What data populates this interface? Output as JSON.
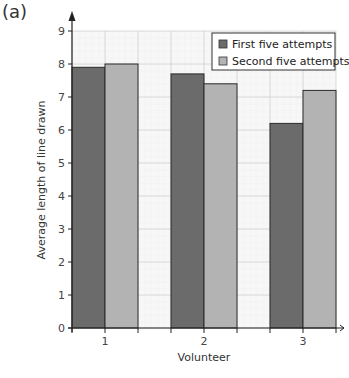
{
  "panel_label": "(a)",
  "chart_data": {
    "type": "bar",
    "title": "",
    "xlabel": "Volunteer",
    "ylabel": "Average length of line drawn",
    "categories": [
      "1",
      "2",
      "3"
    ],
    "series": [
      {
        "name": "First five attempts",
        "values": [
          7.9,
          7.7,
          6.2
        ],
        "color": "#6b6b6b"
      },
      {
        "name": "Second five attempts",
        "values": [
          8.0,
          7.4,
          7.2
        ],
        "color": "#b3b3b3"
      }
    ],
    "yticks": [
      0,
      1,
      2,
      3,
      4,
      5,
      6,
      7,
      8,
      9
    ],
    "ylim": [
      0,
      9
    ],
    "grid": true,
    "legend_position": "top-right"
  }
}
